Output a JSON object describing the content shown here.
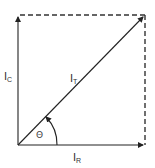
{
  "diagram": {
    "type": "phasor-diagram",
    "vectors": [
      {
        "id": "IC",
        "label_main": "I",
        "label_sub": "C",
        "direction": "vertical-up"
      },
      {
        "id": "IR",
        "label_main": "I",
        "label_sub": "R",
        "direction": "horizontal-right"
      },
      {
        "id": "IT",
        "label_main": "I",
        "label_sub": "T",
        "direction": "diagonal-resultant"
      }
    ],
    "angle": {
      "label": "Θ"
    },
    "colors": {
      "line": "#222222",
      "dashed": "#333333",
      "text": "#333333"
    }
  }
}
